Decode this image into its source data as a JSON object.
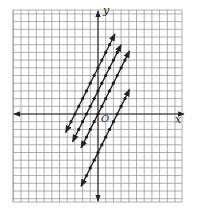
{
  "chart_data": {
    "type": "line",
    "title": "",
    "xlabel": "x",
    "ylabel": "y",
    "origin_label": "O",
    "grid": true,
    "xlim": [
      -11,
      11
    ],
    "ylim": [
      -11,
      13
    ],
    "series": [
      {
        "name": "line-1",
        "equation": "y = 2x + 6",
        "slope": 2,
        "intercept": 6,
        "x_range": [
          -4.2,
          2.2
        ]
      },
      {
        "name": "line-2",
        "equation": "y = 2x + 3",
        "slope": 2,
        "intercept": 3,
        "x_range": [
          -3.3,
          3.0
        ]
      },
      {
        "name": "line-3",
        "equation": "y = 2x",
        "slope": 2,
        "intercept": 0,
        "x_range": [
          -2.2,
          4.1
        ]
      },
      {
        "name": "line-4",
        "equation": "y = 2x - 5",
        "slope": 2,
        "intercept": -5,
        "x_range": [
          -2.2,
          4.1
        ]
      }
    ],
    "colors": {
      "grid": "#9a9a9a",
      "axes": "#222222",
      "lines": "#1a1a1a",
      "background": "#ffffff"
    }
  },
  "labels": {
    "x": "x",
    "y": "y",
    "origin": "O"
  }
}
